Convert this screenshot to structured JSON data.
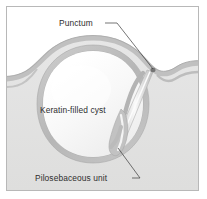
{
  "figure": {
    "frame": {
      "border_color": "#b8b8b8",
      "background_color": "#ffffff"
    },
    "colors": {
      "air_above_skin": "#ffffff",
      "dermis_fill": "#e3e3e3",
      "epidermis_band": "#c3c3c3",
      "cyst_wall": "#bdbdbd",
      "cyst_interior": "#f7f7f7",
      "duct_lumen": "#fbfbfb",
      "label_text": "#2e2e2e",
      "leader_line": "#3a3a3a",
      "punctum_marker": "#6a6a6a"
    },
    "labels": [
      {
        "id": "punctum",
        "text": "Punctum",
        "text_x": 52,
        "text_y": 19,
        "leader_path": "M 98 16 L 110 16 L 148 63",
        "anchor_x": 148,
        "anchor_y": 63
      },
      {
        "id": "keratin-filled-cyst",
        "text": "Keratin-filled cyst",
        "text_x": 33,
        "text_y": 106,
        "leader_path": "",
        "anchor_x": 0,
        "anchor_y": 0
      },
      {
        "id": "pilosebaceous-unit",
        "text": "Pilosebaceous unit",
        "text_x": 28,
        "text_y": 174,
        "leader_path": "M 125 171 L 133 171 L 112 141",
        "anchor_x": 112,
        "anchor_y": 141
      }
    ],
    "structures": [
      {
        "id": "skin-surface",
        "name": "skin surface contour",
        "description": "undulating epidermis band running left to right, bulging upward over the cyst"
      },
      {
        "id": "cyst-wall",
        "name": "cyst wall",
        "description": "thick gray ring enclosing the keratin-filled cavity"
      },
      {
        "id": "cyst-cavity",
        "name": "keratin-filled cavity",
        "description": "pale near-white interior of the cyst"
      },
      {
        "id": "punctum-channel",
        "name": "punctum channel",
        "description": "narrow duct connecting the cyst to the skin surface opening"
      },
      {
        "id": "pilosebaceous-duct",
        "name": "pilosebaceous unit",
        "description": "tapering follicular duct descending below the cyst"
      }
    ]
  }
}
